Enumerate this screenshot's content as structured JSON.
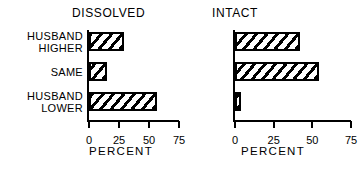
{
  "chart_data": [
    {
      "type": "bar",
      "orientation": "horizontal",
      "title": "DISSOLVED",
      "xlabel": "PERCENT",
      "ylabel": "",
      "categories": [
        "HUSBAND\nHIGHER",
        "SAME",
        "HUSBAND\nLOWER"
      ],
      "values": [
        29,
        15,
        57
      ],
      "xlim": [
        0,
        75
      ],
      "xticks": [
        0,
        25,
        50,
        75
      ],
      "xticklabels": [
        "0",
        "25",
        "50",
        "75"
      ],
      "grid": false,
      "legend": false,
      "bar_style": "diagonal-hatch-black-on-white"
    },
    {
      "type": "bar",
      "orientation": "horizontal",
      "title": "INTACT",
      "xlabel": "PERCENT",
      "ylabel": "",
      "categories": [
        "HUSBAND\nHIGHER",
        "SAME",
        "HUSBAND\nLOWER"
      ],
      "values": [
        42,
        54,
        4
      ],
      "xlim": [
        0,
        75
      ],
      "xticks": [
        0,
        25,
        50,
        75
      ],
      "xticklabels": [
        "0",
        "25",
        "50",
        "75"
      ],
      "grid": false,
      "legend": false,
      "bar_style": "diagonal-hatch-black-on-white"
    }
  ],
  "colors": {
    "ink": "#000000",
    "background": "#ffffff"
  }
}
